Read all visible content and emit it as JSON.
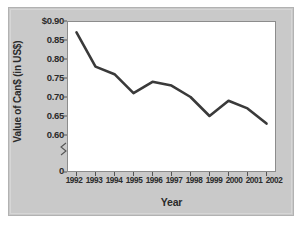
{
  "chart_data": {
    "type": "line",
    "title": "",
    "xlabel": "Year",
    "ylabel": "Value of Can$ (in US$)",
    "categories": [
      "1992",
      "1993",
      "1994",
      "1995",
      "1996",
      "1997",
      "1998",
      "1999",
      "2000",
      "2001",
      "2002"
    ],
    "values": [
      0.87,
      0.78,
      0.76,
      0.71,
      0.74,
      0.73,
      0.7,
      0.65,
      0.69,
      0.67,
      0.63
    ],
    "series": [
      {
        "name": "Value of Can$ (in US$)",
        "values": [
          0.87,
          0.78,
          0.76,
          0.71,
          0.74,
          0.73,
          0.7,
          0.65,
          0.69,
          0.67,
          0.63
        ]
      }
    ],
    "ylim": [
      0.595,
      0.905
    ],
    "ytick_labels": [
      "$0.90",
      "0.85",
      "0.80",
      "0.75",
      "0.70",
      "0.65",
      "0.60",
      "0"
    ],
    "ytick_values": [
      0.9,
      0.85,
      0.8,
      0.75,
      0.7,
      0.65,
      0.6,
      0
    ],
    "xtick_labels": [
      "1992",
      "1993",
      "1994",
      "1995",
      "1996",
      "1997",
      "1998",
      "1999",
      "2000",
      "2001",
      "2002"
    ],
    "axis_break": true,
    "grid": false,
    "legend": "none",
    "line_color": "#3a3a3a",
    "plot_bg": "#ffffff",
    "figure_bg": "#c9c9c9"
  }
}
